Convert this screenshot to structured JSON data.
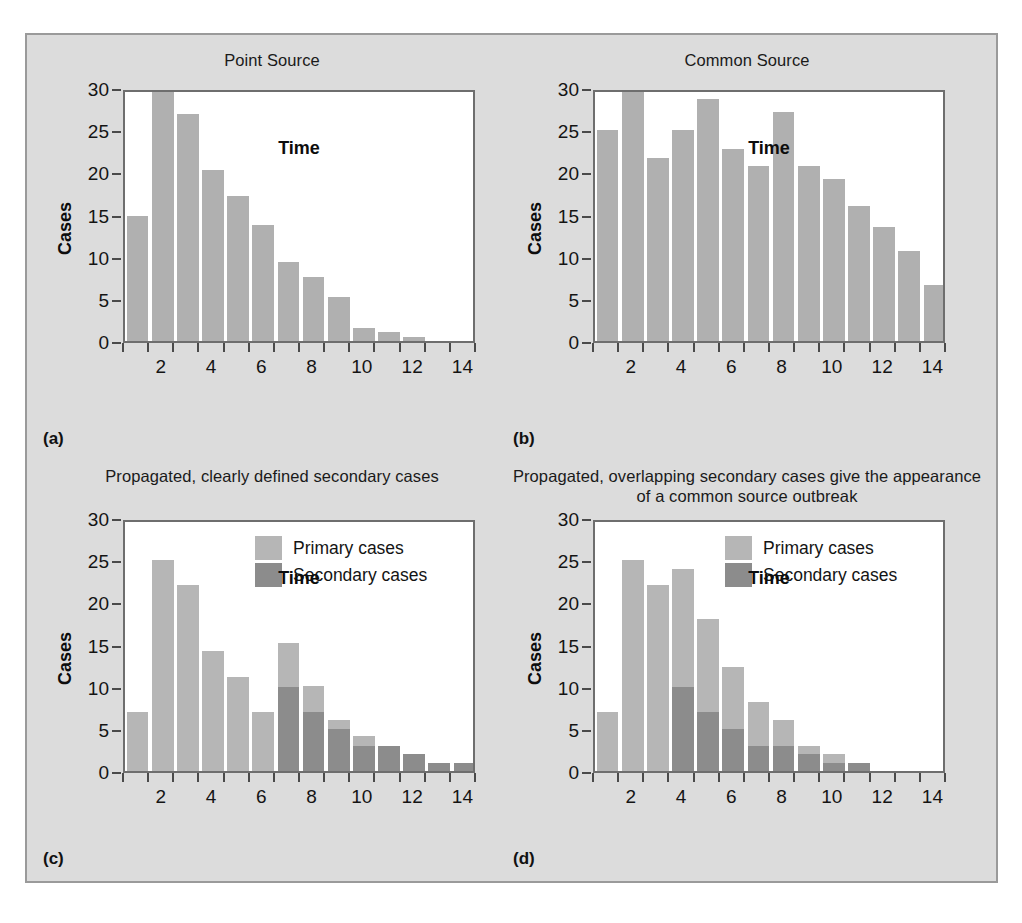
{
  "figure": {
    "background_color": "#dcdcdc",
    "border_color": "#9a9a9a",
    "plot_background": "#ffffff",
    "axis_color": "#6e6e6e"
  },
  "colors": {
    "primary_cases": "#b6b6b6",
    "secondary_cases": "#8c8c8c",
    "bar_single": "#b0b0b0"
  },
  "panels": [
    {
      "id": "a",
      "label": "(a)",
      "title": "Point Source",
      "chart_data": {
        "type": "bar",
        "title": "Point Source",
        "xlabel": "Time",
        "ylabel": "Cases",
        "xlim": [
          1,
          15
        ],
        "ylim": [
          0,
          30
        ],
        "yticks": [
          0,
          5,
          10,
          15,
          20,
          25,
          30
        ],
        "ytick_labels": [
          "0",
          "5",
          "10",
          "15",
          "20",
          "25",
          "30"
        ],
        "xticks": [
          2,
          4,
          6,
          8,
          10,
          12,
          14
        ],
        "xtick_labels": [
          "2",
          "4",
          "6",
          "8",
          "10",
          "12",
          "14"
        ],
        "grid": false,
        "legend": null,
        "x": [
          1,
          2,
          3,
          4,
          5,
          6,
          7,
          8,
          9,
          10,
          11,
          12,
          13,
          14
        ],
        "values": [
          14.8,
          29.8,
          26.9,
          20.3,
          17.2,
          13.8,
          9.4,
          7.6,
          5.2,
          1.5,
          1.1,
          0.5,
          0,
          0
        ]
      }
    },
    {
      "id": "b",
      "label": "(b)",
      "title": "Common Source",
      "chart_data": {
        "type": "bar",
        "title": "Common Source",
        "xlabel": "Time",
        "ylabel": "Cases",
        "xlim": [
          1,
          15
        ],
        "ylim": [
          0,
          30
        ],
        "yticks": [
          0,
          5,
          10,
          15,
          20,
          25,
          30
        ],
        "ytick_labels": [
          "0",
          "5",
          "10",
          "15",
          "20",
          "25",
          "30"
        ],
        "xticks": [
          2,
          4,
          6,
          8,
          10,
          12,
          14
        ],
        "xtick_labels": [
          "2",
          "4",
          "6",
          "8",
          "10",
          "12",
          "14"
        ],
        "grid": false,
        "legend": null,
        "x": [
          1,
          2,
          3,
          4,
          5,
          6,
          7,
          8,
          9,
          10,
          11,
          12,
          13,
          14
        ],
        "values": [
          25.0,
          29.7,
          21.7,
          25.0,
          28.7,
          22.8,
          20.8,
          27.2,
          20.8,
          19.2,
          16.0,
          13.5,
          10.7,
          6.7
        ]
      }
    },
    {
      "id": "c",
      "label": "(c)",
      "title": "Propagated, clearly defined secondary cases",
      "chart_data": {
        "type": "bar",
        "title": "Propagated, clearly defined secondary cases",
        "xlabel": "Time",
        "ylabel": "Cases",
        "xlim": [
          1,
          15
        ],
        "ylim": [
          0,
          30
        ],
        "yticks": [
          0,
          5,
          10,
          15,
          20,
          25,
          30
        ],
        "ytick_labels": [
          "0",
          "5",
          "10",
          "15",
          "20",
          "25",
          "30"
        ],
        "xticks": [
          2,
          4,
          6,
          8,
          10,
          12,
          14
        ],
        "xtick_labels": [
          "2",
          "4",
          "6",
          "8",
          "10",
          "12",
          "14"
        ],
        "grid": false,
        "stacked": true,
        "legend": {
          "position": "top-right",
          "entries": [
            "Primary cases",
            "Secondary cases"
          ]
        },
        "x": [
          1,
          2,
          3,
          4,
          5,
          6,
          7,
          8,
          9,
          10,
          11,
          12,
          13,
          14
        ],
        "series": [
          {
            "name": "Secondary cases",
            "values": [
              0,
              0,
              0,
              0,
              0,
              0,
              10,
              7,
              5,
              3,
              3,
              2,
              1,
              1
            ]
          },
          {
            "name": "Primary cases",
            "values": [
              7,
              25,
              22,
              14.2,
              11.1,
              7,
              5.2,
              3.1,
              1.1,
              1.1,
              0,
              0,
              0,
              0
            ]
          }
        ],
        "totals": [
          7,
          25,
          22,
          14.2,
          11.1,
          7,
          15.2,
          10.1,
          6.1,
          4.1,
          3,
          2,
          1,
          1
        ]
      }
    },
    {
      "id": "d",
      "label": "(d)",
      "title": "Propagated, overlapping secondary cases give the appearance of a common source outbreak",
      "chart_data": {
        "type": "bar",
        "title": "Propagated, overlapping secondary cases give the appearance of a common source outbreak",
        "xlabel": "Time",
        "ylabel": "Cases",
        "xlim": [
          1,
          15
        ],
        "ylim": [
          0,
          30
        ],
        "yticks": [
          0,
          5,
          10,
          15,
          20,
          25,
          30
        ],
        "ytick_labels": [
          "0",
          "5",
          "10",
          "15",
          "20",
          "25",
          "30"
        ],
        "xticks": [
          2,
          4,
          6,
          8,
          10,
          12,
          14
        ],
        "xtick_labels": [
          "2",
          "4",
          "6",
          "8",
          "10",
          "12",
          "14"
        ],
        "grid": false,
        "stacked": true,
        "legend": {
          "position": "top-right",
          "entries": [
            "Primary cases",
            "Secondary cases"
          ]
        },
        "x": [
          1,
          2,
          3,
          4,
          5,
          6,
          7,
          8,
          9,
          10,
          11,
          12,
          13,
          14
        ],
        "series": [
          {
            "name": "Secondary cases",
            "values": [
              0,
              0,
              0,
              10,
              7,
              5,
              3,
              3,
              2,
              1,
              1,
              0,
              0,
              0
            ]
          },
          {
            "name": "Primary cases",
            "values": [
              7,
              25,
              22,
              14,
              11,
              7.3,
              5.2,
              3,
              1,
              1,
              0,
              0,
              0,
              0
            ]
          }
        ],
        "totals": [
          7,
          25,
          22,
          24,
          18,
          12.3,
          8.2,
          6,
          3,
          2,
          1,
          0,
          0,
          0
        ]
      }
    }
  ]
}
